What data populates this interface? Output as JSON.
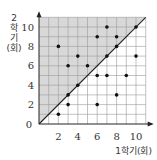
{
  "chart_data": {
    "type": "scatter",
    "title": "",
    "xlabel": "1학기(회)",
    "ylabel": [
      "2",
      "학",
      "기",
      "(회)"
    ],
    "xlim": [
      0,
      11
    ],
    "ylim": [
      0,
      11
    ],
    "x_ticks": [
      "2",
      "4",
      "6",
      "8",
      "10"
    ],
    "y_ticks": [
      "2",
      "4",
      "6",
      "8",
      "10"
    ],
    "origin_label": "0",
    "grid": true,
    "shaded_region": "above diagonal y = x",
    "reference_line": "y = x",
    "points": [
      [
        2,
        8
      ],
      [
        2,
        1
      ],
      [
        3,
        6
      ],
      [
        3,
        3
      ],
      [
        3,
        2
      ],
      [
        4,
        7
      ],
      [
        4,
        4
      ],
      [
        5,
        6
      ],
      [
        6,
        9
      ],
      [
        6,
        5
      ],
      [
        6,
        2
      ],
      [
        7,
        10
      ],
      [
        7,
        7
      ],
      [
        7,
        5
      ],
      [
        8,
        9
      ],
      [
        8,
        8
      ],
      [
        8,
        3
      ],
      [
        9,
        5
      ],
      [
        10,
        10
      ],
      [
        10,
        7
      ]
    ],
    "colors": {
      "shade": "#d8d8d8",
      "grid": "#9a9a9a",
      "point": "#111111",
      "axis": "#222222"
    }
  }
}
